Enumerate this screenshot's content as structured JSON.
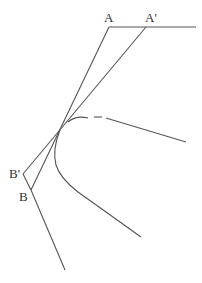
{
  "diagram": {
    "labels": {
      "A": "A",
      "A_prime": "A'",
      "B": "B",
      "B_prime": "B'"
    },
    "colors": {
      "line": "#555555",
      "text": "#333333",
      "background": "#ffffff"
    },
    "points": {
      "A": [
        109,
        27
      ],
      "A_prime": [
        146,
        27
      ],
      "B": [
        31,
        190
      ],
      "B_prime": [
        23,
        174
      ],
      "tangent_point": [
        60,
        130
      ]
    }
  }
}
